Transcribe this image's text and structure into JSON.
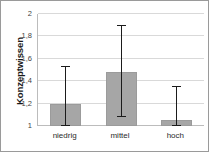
{
  "chart_data": {
    "type": "bar",
    "title": "",
    "xlabel": "",
    "ylabel": "Konzeptwissen",
    "categories": [
      "niedrig",
      "mittel",
      "hoch"
    ],
    "values": [
      1.2,
      1.48,
      1.05
    ],
    "error_low": [
      1.0,
      1.08,
      1.0
    ],
    "error_high": [
      1.53,
      1.89,
      1.35
    ],
    "ylim": [
      1,
      2
    ],
    "ytick_values": [
      1,
      1.2,
      1.4,
      1.6,
      1.8,
      2
    ],
    "ytick_labels": [
      "1",
      "1,2",
      "1,4",
      "1,6",
      "1,8",
      "2"
    ],
    "grid": true,
    "legend": "none",
    "bar_color": "#a6a6a6",
    "error_color": "#1b1b1b",
    "grid_color": "#d9d9d9",
    "axis_color": "#bcbcbc",
    "background_color": "#ffffff",
    "border_color": "#9a9a9a"
  }
}
